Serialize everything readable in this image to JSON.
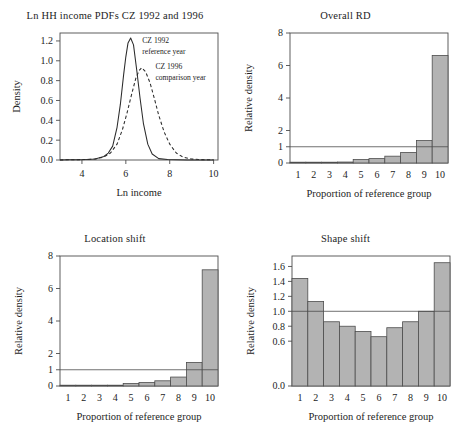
{
  "figure": {
    "panels": [
      "density",
      "overall_rd",
      "location_shift",
      "shape_shift"
    ]
  },
  "chart_data": [
    {
      "id": "density",
      "type": "line",
      "title": "Ln HH income PDFs CZ 1992 and 1996",
      "xlabel": "Ln income",
      "ylabel": "Density",
      "xlim": [
        3.0,
        10.2
      ],
      "ylim": [
        0.0,
        1.28
      ],
      "xticks": [
        4,
        6,
        8,
        10
      ],
      "xticklabels": [
        "4",
        "6",
        "8",
        "10"
      ],
      "yticks": [
        0.0,
        0.2,
        0.4,
        0.6,
        0.8,
        1.0,
        1.2
      ],
      "yticklabels": [
        "0.0",
        "0.2",
        "0.4",
        "0.6",
        "0.8",
        "1.0",
        "1.2"
      ],
      "grid": false,
      "legend": "inline-annotations",
      "annotations": [
        {
          "text_line1": "CZ 1992",
          "text_line2": "reference year",
          "x": 6.75,
          "y": 1.18
        },
        {
          "text_line1": "CZ 1996",
          "text_line2": "comparison year",
          "x": 7.35,
          "y": 0.92
        }
      ],
      "series": [
        {
          "name": "CZ 1992 reference year",
          "style": "solid",
          "mean": 6.22,
          "sd": 0.325,
          "peak": 1.23,
          "x": [
            3.0,
            3.4,
            3.8,
            4.2,
            4.6,
            5.0,
            5.2,
            5.4,
            5.6,
            5.75,
            5.9,
            6.0,
            6.1,
            6.22,
            6.35,
            6.5,
            6.65,
            6.8,
            7.0,
            7.2,
            7.5,
            7.9,
            8.3,
            8.8,
            9.4,
            10.0
          ],
          "y": [
            0.001,
            0.002,
            0.003,
            0.005,
            0.01,
            0.035,
            0.07,
            0.14,
            0.33,
            0.56,
            0.86,
            1.04,
            1.18,
            1.23,
            1.16,
            0.9,
            0.62,
            0.37,
            0.16,
            0.06,
            0.014,
            0.004,
            0.002,
            0.001,
            0.001,
            0.001
          ]
        },
        {
          "name": "CZ 1996 comparison year",
          "style": "dashed",
          "mean": 6.72,
          "sd": 0.43,
          "peak": 0.93,
          "x": [
            3.0,
            3.4,
            3.8,
            4.2,
            4.6,
            5.0,
            5.3,
            5.6,
            5.85,
            6.05,
            6.25,
            6.45,
            6.6,
            6.72,
            6.9,
            7.1,
            7.3,
            7.5,
            7.75,
            8.0,
            8.3,
            8.6,
            9.0,
            9.4,
            10.0
          ],
          "y": [
            0.001,
            0.002,
            0.003,
            0.005,
            0.01,
            0.03,
            0.07,
            0.16,
            0.31,
            0.47,
            0.65,
            0.82,
            0.9,
            0.93,
            0.89,
            0.78,
            0.62,
            0.45,
            0.28,
            0.16,
            0.07,
            0.03,
            0.01,
            0.004,
            0.002
          ]
        }
      ]
    },
    {
      "id": "overall_rd",
      "type": "bar",
      "title": "Overall RD",
      "xlabel": "Proportion of reference group",
      "ylabel": "Relative density",
      "categories": [
        "1",
        "2",
        "3",
        "4",
        "5",
        "6",
        "7",
        "8",
        "9",
        "10"
      ],
      "values": [
        0.03,
        0.03,
        0.04,
        0.06,
        0.21,
        0.27,
        0.42,
        0.65,
        1.38,
        6.62
      ],
      "ylim": [
        0,
        8
      ],
      "yticks": [
        0,
        1,
        2,
        4,
        6,
        8
      ],
      "yticklabels": [
        "0",
        "1",
        "2",
        "4",
        "6",
        "8"
      ],
      "reference_line": 1,
      "grid": false
    },
    {
      "id": "location_shift",
      "type": "bar",
      "title": "Location shift",
      "xlabel": "Proportion of reference group",
      "ylabel": "Relative density",
      "categories": [
        "1",
        "2",
        "3",
        "4",
        "5",
        "6",
        "7",
        "8",
        "9",
        "10"
      ],
      "values": [
        0.02,
        0.02,
        0.03,
        0.05,
        0.15,
        0.21,
        0.32,
        0.55,
        1.45,
        7.15
      ],
      "ylim": [
        0,
        8
      ],
      "yticks": [
        0,
        1,
        2,
        4,
        6,
        8
      ],
      "yticklabels": [
        "0",
        "1",
        "2",
        "4",
        "6",
        "8"
      ],
      "reference_line": 1,
      "grid": false
    },
    {
      "id": "shape_shift",
      "type": "bar",
      "title": "Shape shift",
      "xlabel": "Proportion of reference group",
      "ylabel": "Relative density",
      "categories": [
        "1",
        "2",
        "3",
        "4",
        "5",
        "6",
        "7",
        "8",
        "9",
        "10"
      ],
      "values": [
        1.44,
        1.13,
        0.86,
        0.8,
        0.73,
        0.66,
        0.78,
        0.86,
        1.0,
        1.65
      ],
      "ylim": [
        0.0,
        1.74
      ],
      "yticks": [
        0.0,
        0.6,
        0.8,
        1.0,
        1.2,
        1.4,
        1.6
      ],
      "yticklabels": [
        "0.0",
        "0.6",
        "0.8",
        "1.0",
        "1.2",
        "1.4",
        "1.6"
      ],
      "reference_line": 1.0,
      "grid": false
    }
  ],
  "colors": {
    "bar_fill": "#b3b3b3",
    "bar_stroke": "#4d4d4d",
    "axis": "#4d4d4d",
    "text": "#1d1d1d",
    "background": "#ffffff"
  }
}
